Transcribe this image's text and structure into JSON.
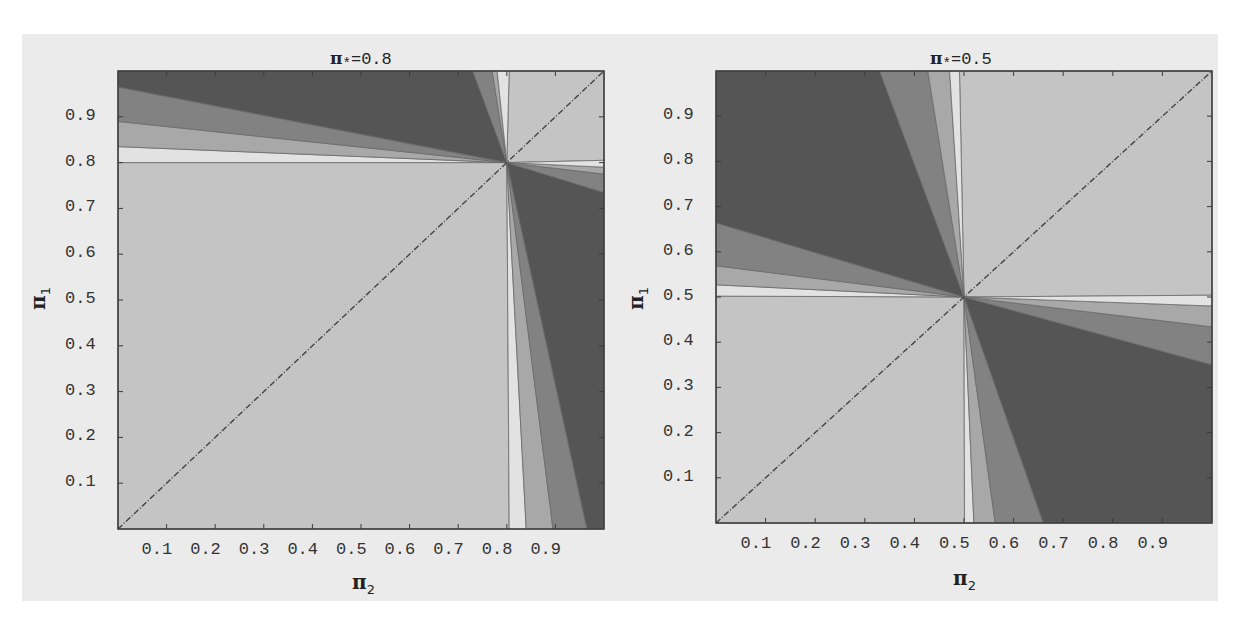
{
  "colors": {
    "figure_bg": "#ebebeb",
    "level_light": "#c4c4c4",
    "level_white": "#e2e2e2",
    "level_midlight": "#a8a8a8",
    "level_mid": "#828282",
    "level_dark": "#555555",
    "frame": "#3a3a3a",
    "diagonal": "#444444"
  },
  "chart_data": [
    {
      "type": "heatmap",
      "subtype": "contour",
      "title": "π*=0.8",
      "title_symbol": "π",
      "title_sub": "*",
      "title_value": "=0.8",
      "xlabel": "π₂",
      "ylabel": "π₁",
      "xlim": [
        0,
        1
      ],
      "ylim": [
        0,
        1
      ],
      "xticks": [
        "0.1",
        "0.2",
        "0.3",
        "0.4",
        "0.5",
        "0.6",
        "0.7",
        "0.8",
        "0.9"
      ],
      "yticks": [
        "0.1",
        "0.2",
        "0.3",
        "0.4",
        "0.5",
        "0.6",
        "0.7",
        "0.8",
        "0.9"
      ],
      "pivot": [
        0.8,
        0.8
      ],
      "diagonal_line": true,
      "regions": [
        {
          "level": "light",
          "poly": [
            [
              0,
              0
            ],
            [
              0.805,
              0
            ],
            [
              0.8,
              0.8
            ],
            [
              0,
              0.8
            ]
          ]
        },
        {
          "level": "light",
          "poly": [
            [
              0.8,
              0.8
            ],
            [
              0.805,
              1
            ],
            [
              1,
              1
            ],
            [
              1,
              0.805
            ]
          ]
        },
        {
          "level": "white",
          "poly": [
            [
              0,
              0.8
            ],
            [
              0.8,
              0.8
            ],
            [
              0,
              0.835
            ]
          ]
        },
        {
          "level": "midlight",
          "poly": [
            [
              0,
              0.835
            ],
            [
              0.8,
              0.8
            ],
            [
              0,
              0.89
            ]
          ]
        },
        {
          "level": "mid",
          "poly": [
            [
              0,
              0.89
            ],
            [
              0.8,
              0.8
            ],
            [
              0,
              0.965
            ]
          ]
        },
        {
          "level": "dark",
          "poly": [
            [
              0,
              0.965
            ],
            [
              0.8,
              0.8
            ],
            [
              0.73,
              1
            ],
            [
              0,
              1
            ]
          ]
        },
        {
          "level": "mid",
          "poly": [
            [
              0.73,
              1
            ],
            [
              0.8,
              0.8
            ],
            [
              0.77,
              1
            ]
          ]
        },
        {
          "level": "midlight",
          "poly": [
            [
              0.77,
              1
            ],
            [
              0.8,
              0.8
            ],
            [
              0.78,
              1
            ]
          ]
        },
        {
          "level": "white",
          "poly": [
            [
              0.78,
              1
            ],
            [
              0.8,
              0.8
            ],
            [
              0.805,
              1
            ]
          ]
        },
        {
          "level": "white",
          "poly": [
            [
              0.8,
              0.8
            ],
            [
              0.805,
              0
            ],
            [
              0.84,
              0
            ]
          ]
        },
        {
          "level": "midlight",
          "poly": [
            [
              0.8,
              0.8
            ],
            [
              0.84,
              0
            ],
            [
              0.895,
              0
            ]
          ]
        },
        {
          "level": "mid",
          "poly": [
            [
              0.8,
              0.8
            ],
            [
              0.895,
              0
            ],
            [
              0.965,
              0
            ]
          ]
        },
        {
          "level": "dark",
          "poly": [
            [
              0.8,
              0.8
            ],
            [
              0.965,
              0
            ],
            [
              1,
              0
            ],
            [
              1,
              0.735
            ]
          ]
        },
        {
          "level": "mid",
          "poly": [
            [
              0.8,
              0.8
            ],
            [
              1,
              0.735
            ],
            [
              1,
              0.775
            ]
          ]
        },
        {
          "level": "midlight",
          "poly": [
            [
              0.8,
              0.8
            ],
            [
              1,
              0.775
            ],
            [
              1,
              0.79
            ]
          ]
        },
        {
          "level": "white",
          "poly": [
            [
              0.8,
              0.8
            ],
            [
              1,
              0.79
            ],
            [
              1,
              0.805
            ]
          ]
        }
      ]
    },
    {
      "type": "heatmap",
      "subtype": "contour",
      "title": "π*=0.5",
      "title_symbol": "π",
      "title_sub": "*",
      "title_value": "=0.5",
      "xlabel": "π₂",
      "ylabel": "π₁",
      "xlim": [
        0,
        1
      ],
      "ylim": [
        0,
        1
      ],
      "xticks": [
        "0.1",
        "0.2",
        "0.3",
        "0.4",
        "0.5",
        "0.6",
        "0.7",
        "0.8",
        "0.9"
      ],
      "yticks": [
        "0.1",
        "0.2",
        "0.3",
        "0.4",
        "0.5",
        "0.6",
        "0.7",
        "0.8",
        "0.9"
      ],
      "pivot": [
        0.5,
        0.5
      ],
      "diagonal_line": true,
      "regions": [
        {
          "level": "light",
          "poly": [
            [
              0,
              0
            ],
            [
              0.501,
              0
            ],
            [
              0.5,
              0.5
            ],
            [
              0,
              0.502
            ]
          ]
        },
        {
          "level": "light",
          "poly": [
            [
              0.5,
              0.5
            ],
            [
              0.491,
              1
            ],
            [
              1,
              1
            ],
            [
              1,
              0.504
            ]
          ]
        },
        {
          "level": "white",
          "poly": [
            [
              0,
              0.502
            ],
            [
              0.5,
              0.5
            ],
            [
              0,
              0.527
            ]
          ]
        },
        {
          "level": "midlight",
          "poly": [
            [
              0,
              0.527
            ],
            [
              0.5,
              0.5
            ],
            [
              0,
              0.569
            ]
          ]
        },
        {
          "level": "mid",
          "poly": [
            [
              0,
              0.569
            ],
            [
              0.5,
              0.5
            ],
            [
              0,
              0.664
            ]
          ]
        },
        {
          "level": "dark",
          "poly": [
            [
              0,
              0.664
            ],
            [
              0.5,
              0.5
            ],
            [
              0.33,
              1
            ],
            [
              0,
              1
            ]
          ]
        },
        {
          "level": "mid",
          "poly": [
            [
              0.33,
              1
            ],
            [
              0.5,
              0.5
            ],
            [
              0.427,
              1
            ]
          ]
        },
        {
          "level": "midlight",
          "poly": [
            [
              0.427,
              1
            ],
            [
              0.5,
              0.5
            ],
            [
              0.471,
              1
            ]
          ]
        },
        {
          "level": "white",
          "poly": [
            [
              0.471,
              1
            ],
            [
              0.5,
              0.5
            ],
            [
              0.491,
              1
            ]
          ]
        },
        {
          "level": "white",
          "poly": [
            [
              0.5,
              0.5
            ],
            [
              0.501,
              0
            ],
            [
              0.52,
              0
            ]
          ]
        },
        {
          "level": "midlight",
          "poly": [
            [
              0.5,
              0.5
            ],
            [
              0.52,
              0
            ],
            [
              0.563,
              0
            ]
          ]
        },
        {
          "level": "mid",
          "poly": [
            [
              0.5,
              0.5
            ],
            [
              0.563,
              0
            ],
            [
              0.66,
              0
            ]
          ]
        },
        {
          "level": "dark",
          "poly": [
            [
              0.5,
              0.5
            ],
            [
              0.66,
              0
            ],
            [
              1,
              0
            ],
            [
              1,
              0.35
            ]
          ]
        },
        {
          "level": "mid",
          "poly": [
            [
              0.5,
              0.5
            ],
            [
              1,
              0.35
            ],
            [
              1,
              0.434
            ]
          ]
        },
        {
          "level": "midlight",
          "poly": [
            [
              0.5,
              0.5
            ],
            [
              1,
              0.434
            ],
            [
              1,
              0.48
            ]
          ]
        },
        {
          "level": "white",
          "poly": [
            [
              0.5,
              0.5
            ],
            [
              1,
              0.48
            ],
            [
              1,
              0.504
            ]
          ]
        }
      ]
    }
  ],
  "layout": {
    "panels": [
      {
        "plot": {
          "x": 118,
          "y": 71,
          "w": 486,
          "h": 458
        }
      },
      {
        "plot": {
          "x": 716,
          "y": 71,
          "w": 496,
          "h": 452
        }
      }
    ]
  }
}
